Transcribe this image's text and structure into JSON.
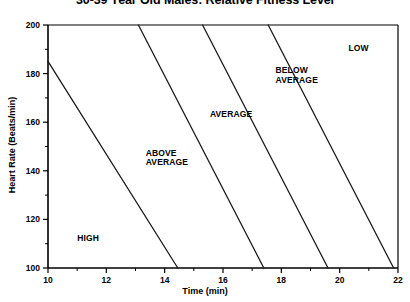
{
  "chart_data": {
    "type": "line",
    "title": "30-39 Year Old Males: Relative Fitness Level",
    "xlabel": "Time (min)",
    "ylabel": "Heart Rate (Beats/min)",
    "xlim": [
      10,
      22
    ],
    "ylim": [
      100,
      200
    ],
    "xticks": [
      10,
      12,
      14,
      16,
      18,
      20,
      22
    ],
    "xticks_minor": [
      11,
      13,
      15,
      17,
      19,
      21
    ],
    "yticks": [
      100,
      120,
      140,
      160,
      180,
      200
    ],
    "yticks_minor": [
      110,
      130,
      150,
      170,
      190
    ],
    "grid": false,
    "legend": "none",
    "line_color": "#1a1a1a",
    "axis_color": "#000000",
    "background": "#ffffff",
    "series": [
      {
        "name": "HIGH / ABOVE AVERAGE boundary",
        "x": [
          10.0,
          14.45
        ],
        "y": [
          185,
          100
        ]
      },
      {
        "name": "ABOVE AVERAGE / AVERAGE boundary",
        "x": [
          13.1,
          17.4
        ],
        "y": [
          200,
          100
        ]
      },
      {
        "name": "AVERAGE / BELOW AVERAGE boundary",
        "x": [
          15.3,
          19.6
        ],
        "y": [
          200,
          100
        ]
      },
      {
        "name": "BELOW AVERAGE / LOW boundary",
        "x": [
          17.55,
          21.85
        ],
        "y": [
          200,
          100
        ]
      }
    ],
    "zones": [
      {
        "label": "HIGH",
        "lines": [
          "HIGH"
        ],
        "x": 11.0,
        "y": 114
      },
      {
        "label": "ABOVE AVERAGE",
        "lines": [
          "ABOVE",
          "AVERAGE"
        ],
        "x": 13.35,
        "y": 149
      },
      {
        "label": "AVERAGE",
        "lines": [
          "AVERAGE"
        ],
        "x": 15.55,
        "y": 165
      },
      {
        "label": "BELOW AVERAGE",
        "lines": [
          "BELOW",
          "AVERAGE"
        ],
        "x": 17.8,
        "y": 183
      },
      {
        "label": "LOW",
        "lines": [
          "LOW"
        ],
        "x": 20.3,
        "y": 192
      }
    ]
  }
}
